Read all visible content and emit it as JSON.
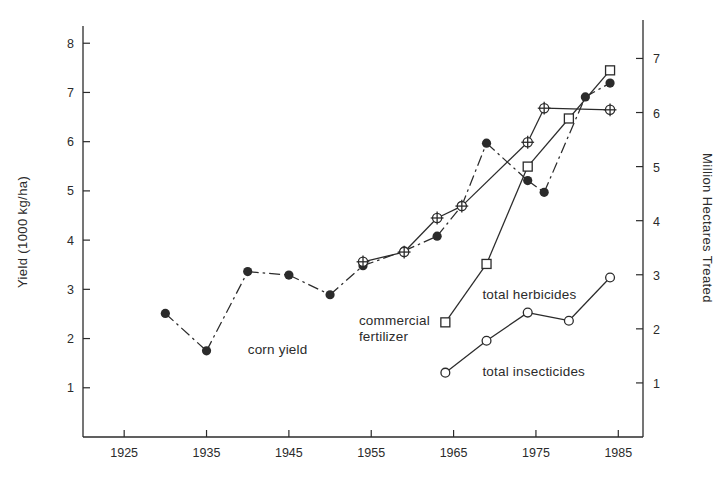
{
  "figure": {
    "background_color": "#ffffff",
    "ink_color": "#2b2b2b"
  },
  "chart_data": {
    "type": "line",
    "title": "",
    "subtitle": "",
    "xlabel": "",
    "ylabel": "Yield  (1000 kg/ha)",
    "y2label": "Million Hectares Treated",
    "grid": false,
    "legend": "inline-annotations",
    "xlim": [
      1920,
      1988
    ],
    "ylim": [
      0,
      8.35
    ],
    "y2lim": [
      0,
      7.6
    ],
    "x_ticks": [
      1925,
      1935,
      1945,
      1955,
      1965,
      1975,
      1985
    ],
    "x_tick_labels": [
      "1925",
      "1935",
      "1945",
      "1955",
      "1965",
      "1975",
      "1985"
    ],
    "y_ticks": [
      1,
      2,
      3,
      4,
      5,
      6,
      7,
      8
    ],
    "y_tick_labels": [
      "1",
      "2",
      "3",
      "4",
      "5",
      "6",
      "7",
      "8"
    ],
    "y2_ticks": [
      1,
      2,
      3,
      4,
      5,
      6,
      7
    ],
    "y2_tick_labels": [
      "1",
      "2",
      "3",
      "4",
      "5",
      "6",
      "7"
    ],
    "series": [
      {
        "name": "corn yield",
        "axis": "left",
        "marker": "filled-circle",
        "line_style": "dash-dot",
        "x": [
          1930,
          1935,
          1940,
          1945,
          1950,
          1954,
          1959,
          1963,
          1966,
          1969,
          1974,
          1976,
          1981,
          1984
        ],
        "values": [
          2.51,
          1.75,
          3.36,
          3.29,
          2.89,
          3.48,
          3.78,
          4.08,
          4.7,
          5.97,
          5.21,
          4.97,
          6.91,
          7.19
        ]
      },
      {
        "name": "commercial fertilizer",
        "axis": "right",
        "marker": "crossed-circle",
        "line_style": "solid",
        "x": [
          1954,
          1959,
          1963,
          1966,
          1974,
          1976,
          1984
        ],
        "values": [
          3.24,
          3.42,
          4.05,
          4.27,
          5.45,
          6.08,
          6.05
        ]
      },
      {
        "name": "total herbicides",
        "axis": "right",
        "marker": "open-square",
        "line_style": "solid",
        "x": [
          1964,
          1969,
          1974,
          1979,
          1984
        ],
        "values": [
          2.12,
          3.2,
          5.0,
          5.89,
          6.78
        ]
      },
      {
        "name": "total insecticides",
        "axis": "right",
        "marker": "open-circle",
        "line_style": "solid",
        "x": [
          1964,
          1969,
          1974,
          1979,
          1984
        ],
        "values": [
          1.19,
          1.78,
          2.3,
          2.15,
          2.95
        ]
      }
    ],
    "annotations": [
      {
        "text": "corn yield",
        "x": 1940,
        "y": 1.68
      },
      {
        "text": "commercial",
        "x": 1953.5,
        "y": 2.28
      },
      {
        "text": "fertilizer",
        "x": 1953.5,
        "y": 1.96
      },
      {
        "text": "total herbicides",
        "x": 1968.5,
        "y": 2.8
      },
      {
        "text": "total insecticides",
        "x": 1968.5,
        "y": 1.23
      }
    ]
  }
}
